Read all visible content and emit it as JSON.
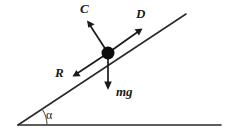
{
  "diagram": {
    "type": "physics-force-diagram",
    "canvas": {
      "width": 235,
      "height": 137
    },
    "colors": {
      "background": "#ffffff",
      "line": "#2a2a2a",
      "arrow": "#1a1a1a",
      "particle": "#0d0d0d",
      "arc": "#555555",
      "text": "#1a1a1a"
    },
    "ground": {
      "name": "horizontal-ground-line",
      "x1": 18,
      "y1": 125,
      "x2": 221,
      "y2": 125
    },
    "incline": {
      "name": "inclined-plane-line",
      "x1": 18,
      "y1": 125,
      "x2": 186,
      "y2": 14
    },
    "angle": {
      "label": "α",
      "label_x": 46,
      "label_y": 119,
      "vertex_x": 18,
      "vertex_y": 125,
      "arc_radius": 29
    },
    "particle": {
      "label": "particle",
      "cx": 108,
      "cy": 53,
      "r": 6.5
    },
    "forces": [
      {
        "id": "C",
        "label": "C",
        "description": "normal reaction perpendicular to incline",
        "x1": 108,
        "y1": 53,
        "x2": 87,
        "y2": 21,
        "label_x": 80,
        "label_y": 13
      },
      {
        "id": "D",
        "label": "D",
        "description": "driving force up the incline",
        "x1": 108,
        "y1": 53,
        "x2": 142,
        "y2": 29,
        "label_x": 136,
        "label_y": 18
      },
      {
        "id": "R",
        "label": "R",
        "description": "resistance force down the incline",
        "x1": 108,
        "y1": 53,
        "x2": 73,
        "y2": 76,
        "label_x": 55,
        "label_y": 77
      },
      {
        "id": "mg",
        "label": "mg",
        "description": "weight acting vertically downward",
        "x1": 108,
        "y1": 53,
        "x2": 108,
        "y2": 89,
        "label_x": 116,
        "label_y": 96
      }
    ]
  }
}
